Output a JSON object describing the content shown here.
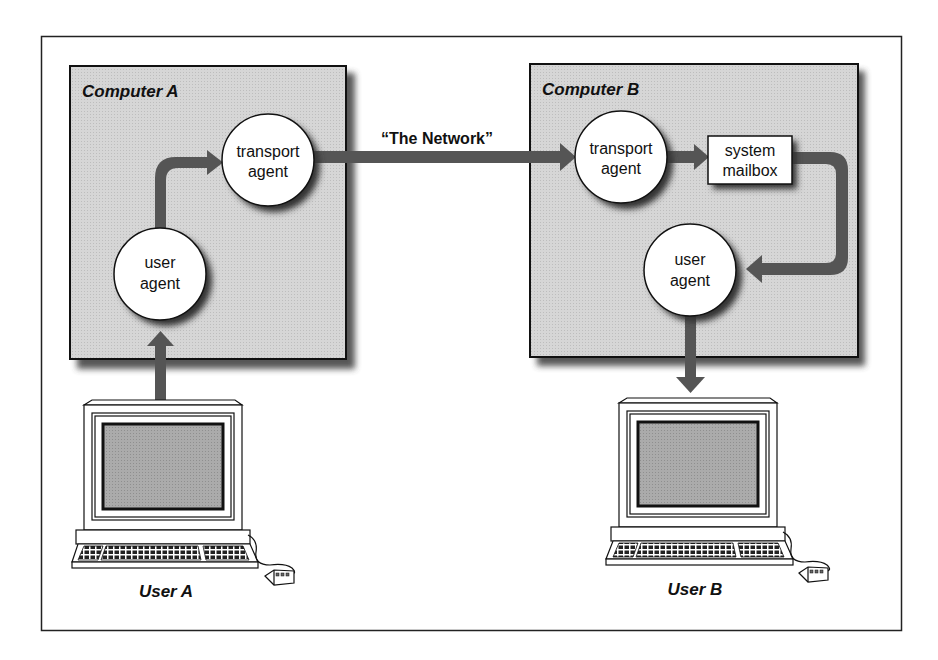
{
  "diagram": {
    "type": "mail-transport-flow",
    "network_label": "“The Network”",
    "computers": [
      {
        "title": "Computer A",
        "nodes": [
          {
            "id": "ua-a",
            "shape": "circle",
            "line1": "user",
            "line2": "agent"
          },
          {
            "id": "ta-a",
            "shape": "circle",
            "line1": "transport",
            "line2": "agent"
          }
        ]
      },
      {
        "title": "Computer B",
        "nodes": [
          {
            "id": "ta-b",
            "shape": "circle",
            "line1": "transport",
            "line2": "agent"
          },
          {
            "id": "mb-b",
            "shape": "box",
            "line1": "system",
            "line2": "mailbox"
          },
          {
            "id": "ua-b",
            "shape": "circle",
            "line1": "user",
            "line2": "agent"
          }
        ]
      }
    ],
    "users": [
      {
        "label": "User A"
      },
      {
        "label": "User B"
      }
    ],
    "edges": [
      {
        "from": "User A",
        "to": "ua-a"
      },
      {
        "from": "ua-a",
        "to": "ta-a"
      },
      {
        "from": "ta-a",
        "to": "ta-b",
        "label": "“The Network”"
      },
      {
        "from": "ta-b",
        "to": "mb-b"
      },
      {
        "from": "mb-b",
        "to": "ua-b"
      },
      {
        "from": "ua-b",
        "to": "User B"
      }
    ],
    "colors": {
      "box_fill": "#d4d4d4",
      "arrow": "#555555",
      "screen": "#a8a8a8",
      "border": "#111111"
    }
  }
}
